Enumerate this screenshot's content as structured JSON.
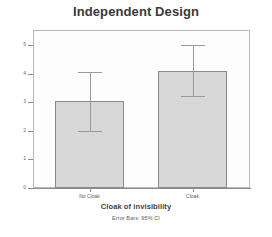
{
  "chart_data": {
    "type": "bar",
    "title": "Independent Design",
    "xlabel": "Cloak of invisibility",
    "ylabel": "Mean Mischievous Acts",
    "categories": [
      "No Cloak",
      "Cloak"
    ],
    "values": [
      3.05,
      4.1
    ],
    "error_low": [
      2.0,
      3.2
    ],
    "error_high": [
      4.05,
      5.0
    ],
    "ylim": [
      0,
      5
    ],
    "yticks": [
      0,
      1,
      2,
      3,
      4,
      5
    ],
    "ytick_labels": [
      "0",
      "1",
      "2",
      "3",
      "4",
      "5"
    ],
    "grid": false,
    "legend": "none",
    "annotation": "Error Bars: 95% CI",
    "bar_color": "#d8d8d8",
    "bar_edge_color": "#8a8a8a",
    "error_color": "#9a9a9a",
    "frame_color": "#b9b9b9",
    "background": "#ffffff",
    "plot_background": "#fdfdfd"
  },
  "footnote": "Error Bars: 95% CI"
}
